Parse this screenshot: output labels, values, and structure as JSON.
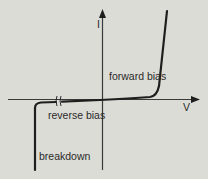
{
  "diagram": {
    "axes": {
      "x_label": "V",
      "y_label": "I"
    },
    "regions": {
      "forward": "forward bias",
      "reverse": "reverse bias",
      "breakdown": "breakdown"
    },
    "colors": {
      "background": "#dcdcd6",
      "ink": "#1e1e1e"
    }
  }
}
